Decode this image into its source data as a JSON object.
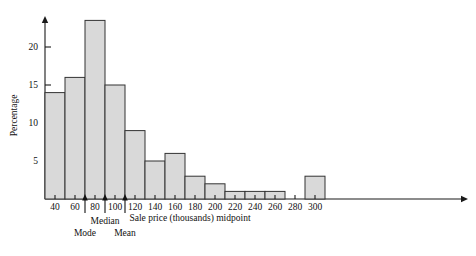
{
  "chart_data": {
    "type": "bar",
    "title": "",
    "subtitle": "",
    "xlabel": "Sale price (thousands) midpoint",
    "ylabel": "Percentage",
    "categories": [
      40,
      60,
      80,
      100,
      120,
      140,
      160,
      180,
      200,
      220,
      240,
      260,
      300
    ],
    "values": [
      14,
      16,
      23.5,
      15,
      9,
      5,
      6,
      3,
      2,
      1,
      1,
      1,
      3
    ],
    "xlim": [
      30,
      310
    ],
    "ylim": [
      0,
      25
    ],
    "xticks": [
      40,
      60,
      80,
      100,
      120,
      140,
      160,
      180,
      200,
      220,
      240,
      260,
      280,
      300
    ],
    "yticks": [
      5,
      10,
      15,
      20
    ],
    "grid": false,
    "legend": "none",
    "bar_width": 20,
    "annotations": [
      {
        "label": "Mode",
        "x": 70,
        "stack": 1
      },
      {
        "label": "Median",
        "x": 90,
        "stack": 0
      },
      {
        "label": "Mean",
        "x": 110,
        "stack": 1
      }
    ]
  },
  "axis": {
    "y_title": "Percentage",
    "x_title": "Sale price (thousands) midpoint"
  }
}
